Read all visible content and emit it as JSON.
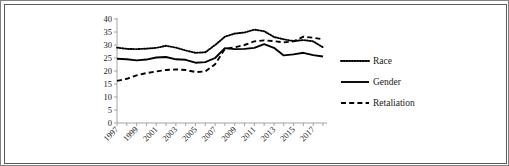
{
  "figure": {
    "border_color": "#5a5a5a",
    "background": "#ffffff"
  },
  "chart_data": {
    "type": "line",
    "title": "",
    "subtitle": "",
    "xlabel": "",
    "ylabel": "",
    "xlim": [
      1997,
      2018
    ],
    "ylim": [
      0,
      40
    ],
    "y_ticks": [
      0,
      5,
      10,
      15,
      20,
      25,
      30,
      35,
      40
    ],
    "grid": false,
    "legend_position": "right",
    "x": [
      1997,
      1998,
      1999,
      2000,
      2001,
      2002,
      2003,
      2004,
      2005,
      2006,
      2007,
      2008,
      2009,
      2010,
      2011,
      2012,
      2013,
      2014,
      2015,
      2016,
      2017,
      2018
    ],
    "x_tick_labels": [
      "1997",
      "1999",
      "2001",
      "2003",
      "2005",
      "2007",
      "2009",
      "2011",
      "2013",
      "2015",
      "2017"
    ],
    "x_tick_values": [
      1997,
      1999,
      2001,
      2003,
      2005,
      2007,
      2009,
      2011,
      2013,
      2015,
      2017
    ],
    "series": [
      {
        "name": "Race",
        "style": "dotted",
        "color": "#000000",
        "values": [
          29.0,
          28.5,
          28.4,
          28.6,
          28.9,
          29.7,
          29.0,
          27.9,
          27.0,
          27.2,
          30.0,
          33.2,
          34.4,
          34.8,
          35.9,
          35.3,
          33.1,
          32.2,
          31.5,
          31.9,
          31.4,
          29.1
        ]
      },
      {
        "name": "Gender",
        "style": "solid",
        "color": "#000000",
        "values": [
          24.7,
          24.5,
          24.1,
          24.4,
          25.2,
          25.4,
          24.5,
          24.3,
          23.2,
          23.4,
          25.0,
          28.8,
          28.4,
          28.5,
          28.9,
          30.3,
          28.9,
          26.0,
          26.4,
          27.0,
          26.1,
          25.6
        ]
      },
      {
        "name": "Retaliation",
        "style": "dashed",
        "color": "#000000",
        "values": [
          16.2,
          17.0,
          18.3,
          19.2,
          19.8,
          20.4,
          20.6,
          20.4,
          19.6,
          19.8,
          22.6,
          28.5,
          29.1,
          30.0,
          31.4,
          31.8,
          31.5,
          31.0,
          31.4,
          33.2,
          32.8,
          32.2
        ]
      }
    ]
  },
  "legend": {
    "items": [
      {
        "label": "Race",
        "style": "dotted"
      },
      {
        "label": "Gender",
        "style": "solid"
      },
      {
        "label": "Retaliation",
        "style": "dashed"
      }
    ]
  }
}
